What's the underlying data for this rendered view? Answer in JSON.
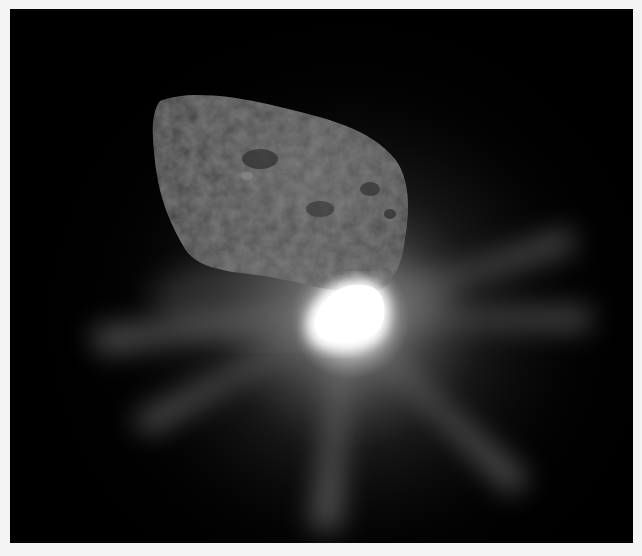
{
  "image": {
    "subject": "comet nucleus with bright impact flash",
    "colors": {
      "page_background": "#f4f4f4",
      "space": "#000000",
      "nucleus": "#4a4a4a",
      "flash": "#ffffff"
    }
  }
}
